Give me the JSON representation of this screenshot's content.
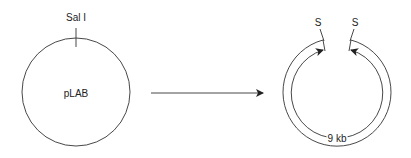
{
  "left_plasmid": {
    "name": "pLAB",
    "site_label": "Sal I"
  },
  "right_plasmid": {
    "cut_site_left": "S",
    "cut_site_right": "S",
    "size_label": "9 kb"
  },
  "colors": {
    "stroke": "#333333",
    "background": "#ffffff"
  }
}
